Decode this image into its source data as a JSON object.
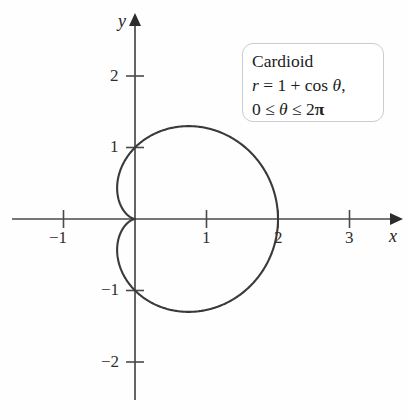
{
  "figure": {
    "background_color": "#fefefe",
    "curve_color": "#3a3a3a",
    "axis_color": "#4a4a4a",
    "box_border_color": "#c9ccd1"
  },
  "axes": {
    "x_axis_name": "x",
    "y_axis_name": "y",
    "x_ticks": [
      {
        "value": -1,
        "label": "−1"
      },
      {
        "value": 1,
        "label": "1"
      },
      {
        "value": 2,
        "label": "2"
      },
      {
        "value": 3,
        "label": "3"
      }
    ],
    "y_ticks": [
      {
        "value": 2,
        "label": "2"
      },
      {
        "value": 1,
        "label": "1"
      },
      {
        "value": -1,
        "label": "−1"
      },
      {
        "value": -2,
        "label": "−2"
      }
    ]
  },
  "label_box": {
    "title": "Cardioid",
    "equation_lhs": "r",
    "equation_eq": "=",
    "equation_rhs": "1 + cos",
    "equation_theta": "θ",
    "equation_comma": ",",
    "domain_lower": "0 ≤",
    "domain_theta": "θ",
    "domain_upper": "≤ 2",
    "domain_pi": "π"
  },
  "chart_data": {
    "type": "line",
    "title": "Cardioid",
    "xlabel": "x",
    "ylabel": "y",
    "grid": false,
    "legend": "none",
    "polar_equation": "r = 1 + cos(theta)",
    "theta_range": [
      0,
      6.283185307179586
    ],
    "xlim": [
      -1.7,
      3.75
    ],
    "ylim": [
      -2.85,
      2.85
    ],
    "xticks": [
      -1,
      1,
      2,
      3
    ],
    "yticks": [
      -2,
      -1,
      1,
      2
    ],
    "annotations": [
      "Cardioid",
      "r = 1 + cos θ,",
      "0 ≤ θ ≤ 2π"
    ],
    "key_points": [
      {
        "theta": 0,
        "r": 2,
        "x": 2,
        "y": 0
      },
      {
        "theta": 1.5707963,
        "r": 1,
        "x": 0,
        "y": 1
      },
      {
        "theta": 3.1415927,
        "r": 0,
        "x": 0,
        "y": 0
      },
      {
        "theta": 4.712389,
        "r": 1,
        "x": 0,
        "y": -1
      },
      {
        "theta": 2.0943951,
        "r": 0.5,
        "x": -0.25,
        "y": 0.4330127
      },
      {
        "theta": 1.0471976,
        "r": 1.5,
        "x": 0.75,
        "y": 1.2990381
      }
    ],
    "max_radius": 2,
    "leftmost_x": -0.25,
    "topmost_y": 1.2990381,
    "bottommost_y": -1.2990381
  }
}
